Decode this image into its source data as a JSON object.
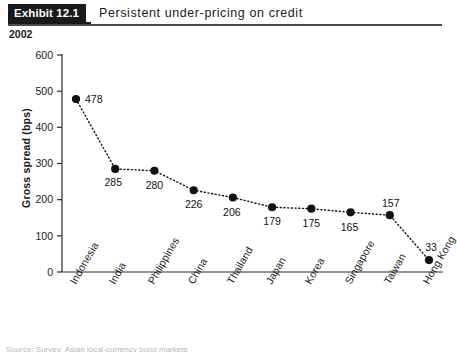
{
  "header": {
    "badge": "Exhibit 12.1",
    "title": "Persistent under-pricing on credit"
  },
  "chart_year": "2002",
  "bottom_note": "Source: Survey; Asian local-currency bond markets",
  "chart_data": {
    "type": "line",
    "title": "Persistent under-pricing on credit",
    "subtitle": "2002",
    "xlabel": "",
    "ylabel": "Gross spread (bps)",
    "ylim": [
      0,
      600
    ],
    "ytick_labels": [
      "0",
      "100",
      "200",
      "300",
      "400",
      "500",
      "600"
    ],
    "ytick_values": [
      0,
      100,
      200,
      300,
      400,
      500,
      600
    ],
    "grid": false,
    "legend": false,
    "marker": "filled-circle",
    "linestyle": "dotted",
    "series_color": "#111111",
    "categories": [
      "Indonesia",
      "India",
      "Philippines",
      "China",
      "Thailand",
      "Japan",
      "Korea",
      "Singapore",
      "Taiwan",
      "Hong Kong"
    ],
    "values": [
      478,
      285,
      280,
      226,
      206,
      179,
      175,
      165,
      157,
      33
    ],
    "point_labels": [
      "478",
      "285",
      "280",
      "226",
      "206",
      "179",
      "175",
      "165",
      "157",
      "33"
    ]
  }
}
